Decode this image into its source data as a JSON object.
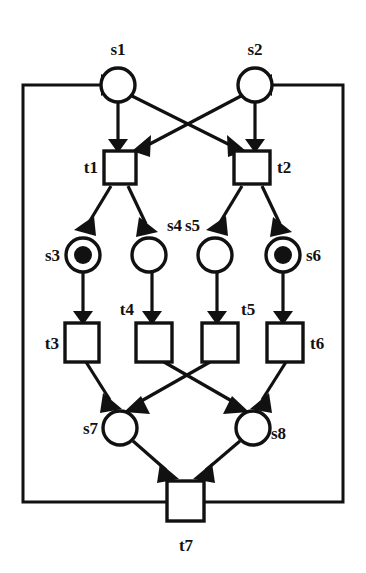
{
  "diagram": {
    "kind": "petri-net",
    "background_color": "#ffffff",
    "stroke_color": "#111111",
    "places": [
      {
        "id": "s1",
        "label": "s1",
        "cx": 118,
        "cy": 85,
        "r": 17,
        "tokens": 0,
        "label_x": 118,
        "label_y": 55,
        "label_anchor": "middle"
      },
      {
        "id": "s2",
        "label": "s2",
        "cx": 255,
        "cy": 85,
        "r": 17,
        "tokens": 0,
        "label_x": 255,
        "label_y": 55,
        "label_anchor": "middle"
      },
      {
        "id": "s3",
        "label": "s3",
        "cx": 83,
        "cy": 255,
        "r": 17,
        "tokens": 1,
        "label_x": 58,
        "label_y": 261,
        "label_anchor": "end"
      },
      {
        "id": "s4",
        "label": "s4",
        "cx": 149,
        "cy": 255,
        "r": 17,
        "tokens": 0,
        "label_x": 173,
        "label_y": 230,
        "label_anchor": "start"
      },
      {
        "id": "s5",
        "label": "s5",
        "cx": 215,
        "cy": 255,
        "r": 17,
        "tokens": 0,
        "label_x": 196,
        "label_y": 230,
        "label_anchor": "end"
      },
      {
        "id": "s6",
        "label": "s6",
        "cx": 283,
        "cy": 255,
        "r": 17,
        "tokens": 1,
        "label_x": 308,
        "label_y": 261,
        "label_anchor": "start"
      },
      {
        "id": "s7",
        "label": "s7",
        "cx": 120,
        "cy": 428,
        "r": 17,
        "tokens": 0,
        "label_x": 96,
        "label_y": 434,
        "label_anchor": "end"
      },
      {
        "id": "s8",
        "label": "s8",
        "cx": 253,
        "cy": 428,
        "r": 17,
        "tokens": 0,
        "label_x": 273,
        "label_y": 439,
        "label_anchor": "start"
      }
    ],
    "transitions": [
      {
        "id": "t1",
        "label": "t1",
        "x": 104,
        "y": 151,
        "w": 32,
        "h": 33,
        "label_x": 98,
        "label_y": 173,
        "label_anchor": "end"
      },
      {
        "id": "t2",
        "label": "t2",
        "x": 234,
        "y": 151,
        "w": 36,
        "h": 33,
        "label_x": 277,
        "label_y": 173,
        "label_anchor": "start"
      },
      {
        "id": "t3",
        "label": "t3",
        "x": 65,
        "y": 323,
        "w": 34,
        "h": 39,
        "label_x": 59,
        "label_y": 348,
        "label_anchor": "end"
      },
      {
        "id": "t4",
        "label": "t4",
        "x": 136,
        "y": 323,
        "w": 36,
        "h": 39,
        "label_x": 132,
        "label_y": 315,
        "label_anchor": "end"
      },
      {
        "id": "t5",
        "label": "t5",
        "x": 202,
        "y": 323,
        "w": 36,
        "h": 39,
        "label_x": 242,
        "label_y": 315,
        "label_anchor": "start"
      },
      {
        "id": "t6",
        "label": "t6",
        "x": 267,
        "y": 323,
        "w": 36,
        "h": 39,
        "label_x": 310,
        "label_y": 348,
        "label_anchor": "start"
      },
      {
        "id": "t7",
        "label": "t7",
        "x": 167,
        "y": 481,
        "w": 37,
        "h": 40,
        "label_x": 186,
        "label_y": 551,
        "label_anchor": "middle"
      }
    ],
    "arcs": [
      {
        "id": "s1-t1",
        "from": "s1",
        "to": "t1"
      },
      {
        "id": "s1-t2",
        "from": "s1",
        "to": "t2"
      },
      {
        "id": "s2-t1",
        "from": "s2",
        "to": "t1"
      },
      {
        "id": "s2-t2",
        "from": "s2",
        "to": "t2"
      },
      {
        "id": "t1-s3",
        "from": "t1",
        "to": "s3"
      },
      {
        "id": "t1-s4",
        "from": "t1",
        "to": "s4"
      },
      {
        "id": "t2-s5",
        "from": "t2",
        "to": "s5"
      },
      {
        "id": "t2-s6",
        "from": "t2",
        "to": "s6"
      },
      {
        "id": "s3-t3",
        "from": "s3",
        "to": "t3"
      },
      {
        "id": "s4-t4",
        "from": "s4",
        "to": "t4"
      },
      {
        "id": "s5-t5",
        "from": "s5",
        "to": "t5"
      },
      {
        "id": "s6-t6",
        "from": "s6",
        "to": "t6"
      },
      {
        "id": "t3-s7",
        "from": "t3",
        "to": "s7"
      },
      {
        "id": "t4-s8",
        "from": "t4",
        "to": "s8"
      },
      {
        "id": "t5-s7",
        "from": "t5",
        "to": "s7"
      },
      {
        "id": "t6-s8",
        "from": "t6",
        "to": "s8"
      },
      {
        "id": "s7-t7",
        "from": "s7",
        "to": "t7"
      },
      {
        "id": "s8-t7",
        "from": "s8",
        "to": "t7"
      },
      {
        "id": "t7-s1",
        "from": "t7",
        "to": "s1",
        "routing": "left-rail"
      },
      {
        "id": "t7-s2",
        "from": "t7",
        "to": "s2",
        "routing": "right-rail"
      }
    ],
    "feedback_rail": {
      "left_x": 23,
      "right_x": 343,
      "top_y": 85,
      "bottom_y": 502,
      "arrow_into_s1_x": 101,
      "arrow_into_s2_x": 272
    }
  }
}
